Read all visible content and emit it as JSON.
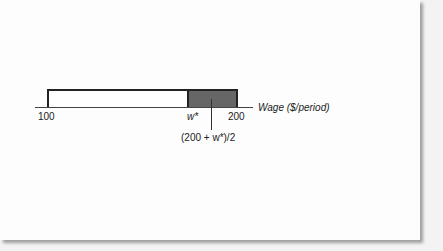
{
  "diagram": {
    "axis_label": "Wage ($/period)",
    "ticks": [
      {
        "label": "100",
        "value": 100
      },
      {
        "label": "w*",
        "value": "w*"
      },
      {
        "label": "200",
        "value": 200
      }
    ],
    "midpoint_label": "(200 + w*)/2",
    "regions": [
      {
        "from": "100",
        "to": "w*",
        "fill": "#ffffff"
      },
      {
        "from": "w*",
        "to": "200",
        "fill": "#666666"
      }
    ]
  }
}
